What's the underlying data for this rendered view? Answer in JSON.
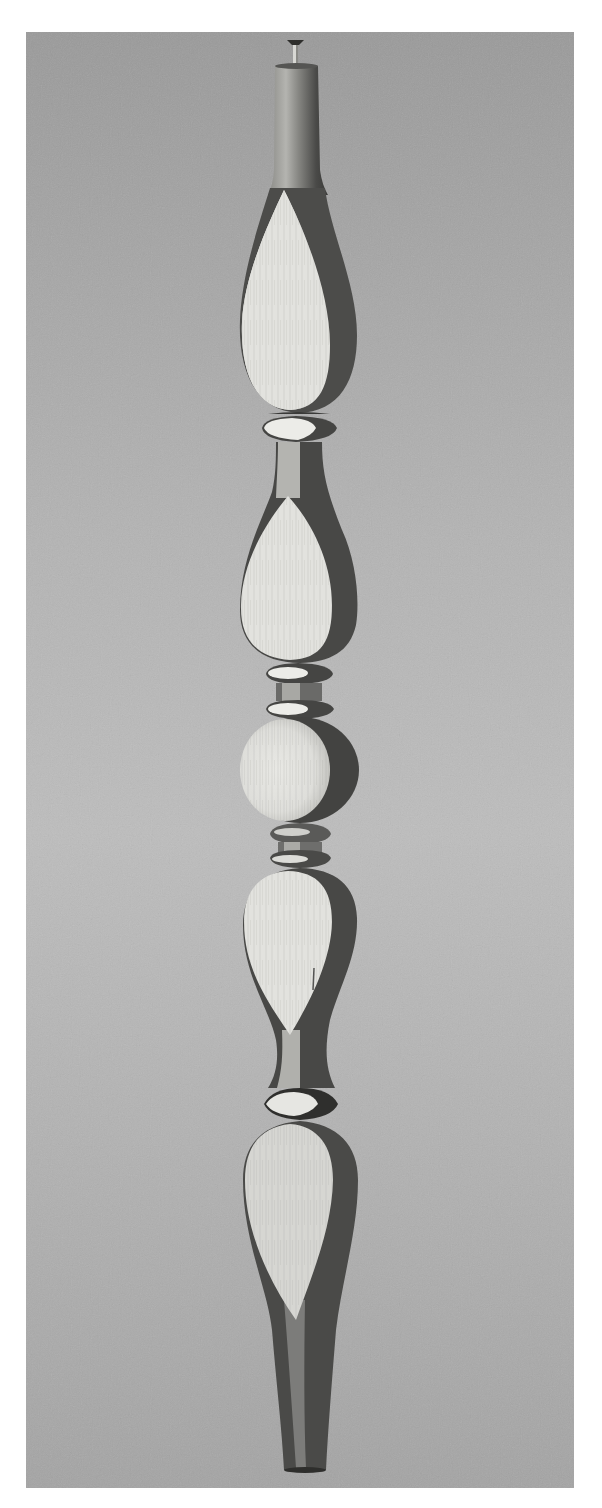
{
  "image": {
    "subject": "turned wooden spindle",
    "style": "black-and-white photograph",
    "frame": {
      "left": 26,
      "top": 32,
      "width": 548,
      "height": 1456
    }
  },
  "colors": {
    "page_background": "#ffffff",
    "backdrop_top": "#9c9c9c",
    "backdrop_middle": "#bdbdbd",
    "backdrop_bottom": "#a6a6a6",
    "wood_highlight": "#e4e4e0",
    "wood_mid": "#9a9a96",
    "wood_shadow": "#4a4a48",
    "wood_dark": "#2e2e2c"
  },
  "spindle_parts": [
    {
      "name": "pin",
      "y_top": 40,
      "y_bottom": 64
    },
    {
      "name": "top-taper",
      "y_top": 64,
      "y_bottom": 190
    },
    {
      "name": "bulb-1",
      "y_top": 190,
      "y_bottom": 414
    },
    {
      "name": "collar-1",
      "y_top": 416,
      "y_bottom": 442
    },
    {
      "name": "bulb-2",
      "y_top": 442,
      "y_bottom": 662
    },
    {
      "name": "double-collar-1",
      "y_top": 662,
      "y_bottom": 718
    },
    {
      "name": "ball",
      "y_top": 718,
      "y_bottom": 824
    },
    {
      "name": "double-collar-2",
      "y_top": 824,
      "y_bottom": 868
    },
    {
      "name": "bulb-3",
      "y_top": 868,
      "y_bottom": 1086
    },
    {
      "name": "collar-2",
      "y_top": 1086,
      "y_bottom": 1120
    },
    {
      "name": "bottom-bulb-and-foot",
      "y_top": 1120,
      "y_bottom": 1472
    }
  ]
}
